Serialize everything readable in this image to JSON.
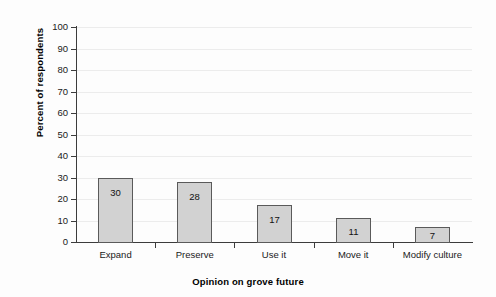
{
  "chart_data": {
    "type": "bar",
    "title": "",
    "xlabel": "Opinion on grove future",
    "ylabel": "Percent of respondents",
    "categories": [
      "Expand",
      "Preserve",
      "Use it",
      "Move it",
      "Modify culture"
    ],
    "values": [
      30,
      28,
      17,
      11,
      7
    ],
    "data_labels": [
      "30",
      "28",
      "17",
      "11",
      "7"
    ],
    "ylim": [
      0,
      100
    ],
    "ytick_labels": [
      "100",
      "90",
      "80",
      "70",
      "60",
      "50",
      "40",
      "30",
      "20",
      "10",
      "0"
    ],
    "ytick_values": [
      100,
      90,
      80,
      70,
      60,
      50,
      40,
      30,
      20,
      10,
      0
    ],
    "grid": "horizontal",
    "legend": "none",
    "colors": {
      "bar_fill": "#d2d2d2",
      "bar_edge": "#5a5a5a",
      "axis": "#3c3c3c",
      "gridline": "#ececec",
      "text": "#1a1a1a",
      "background": "#fdfdfd"
    }
  }
}
